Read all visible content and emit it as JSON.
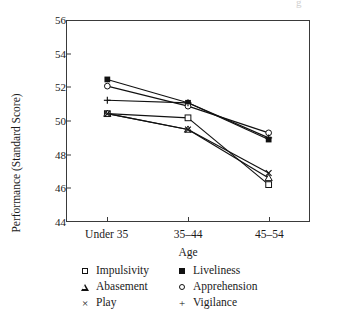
{
  "page_bleed_glyph": "g",
  "chart_data": {
    "type": "line",
    "title": "",
    "xlabel": "Age",
    "ylabel": "Performance (Standard Score)",
    "categories": [
      "Under 35",
      "35–44",
      "45–54"
    ],
    "ylim": [
      44,
      56
    ],
    "yticks": [
      44,
      46,
      48,
      50,
      52,
      54,
      56
    ],
    "ytick_labels": [
      "44",
      "46",
      "48",
      "50",
      "52",
      "54",
      "56"
    ],
    "grid": false,
    "legend_position": "below-plot",
    "series": [
      {
        "name": "Impulsivity",
        "marker": "square-open",
        "values": [
          50.45,
          50.2,
          46.2
        ]
      },
      {
        "name": "Liveliness",
        "marker": "square-filled",
        "values": [
          52.5,
          51.1,
          48.9
        ]
      },
      {
        "name": "Abasement",
        "marker": "triangle-open",
        "values": [
          50.45,
          49.5,
          46.6
        ]
      },
      {
        "name": "Apprehension",
        "marker": "circle-open",
        "values": [
          52.1,
          50.9,
          49.3
        ]
      },
      {
        "name": "Play",
        "marker": "cross-x",
        "values": [
          50.45,
          49.5,
          46.9
        ]
      },
      {
        "name": "Vigilance",
        "marker": "plus",
        "values": [
          51.25,
          51.1,
          49.0
        ]
      }
    ]
  },
  "legend": {
    "entries": [
      {
        "label": "Impulsivity",
        "marker": "square-open"
      },
      {
        "label": "Liveliness",
        "marker": "square-filled"
      },
      {
        "label": "Abasement",
        "marker": "triangle-open"
      },
      {
        "label": "Apprehension",
        "marker": "circle-open"
      },
      {
        "label": "Play",
        "marker": "cross-x"
      },
      {
        "label": "Vigilance",
        "marker": "plus"
      }
    ]
  },
  "colors": {
    "ink": "#111111",
    "axis": "#3a3a3a",
    "background": "#ffffff"
  }
}
